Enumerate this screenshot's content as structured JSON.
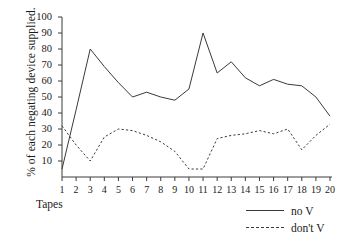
{
  "chart_data": {
    "type": "line",
    "title": "",
    "xlabel": "Tapes",
    "ylabel": "% of each negating device supplied.",
    "xlim": [
      1,
      20
    ],
    "ylim": [
      0,
      100
    ],
    "grid": false,
    "legend_position": "bottom-right",
    "x": [
      1,
      2,
      3,
      4,
      5,
      6,
      7,
      8,
      9,
      10,
      11,
      12,
      13,
      14,
      15,
      16,
      17,
      18,
      19,
      20
    ],
    "xtick_labels": [
      "1",
      "2",
      "3",
      "4",
      "5",
      "6",
      "7",
      "8",
      "9",
      "10",
      "11",
      "12",
      "13",
      "14",
      "15",
      "16",
      "17",
      "18",
      "19",
      "20"
    ],
    "ytick_labels": [
      "10",
      "20",
      "30",
      "40",
      "50",
      "60",
      "70",
      "80",
      "90",
      "100"
    ],
    "yticks": [
      10,
      20,
      30,
      40,
      50,
      60,
      70,
      80,
      90,
      100
    ],
    "series": [
      {
        "name": "no V",
        "style": "solid",
        "color": "#3a3a3a",
        "values": [
          5,
          42,
          80,
          69,
          59,
          50,
          53,
          50,
          48,
          55,
          90,
          65,
          72,
          62,
          57,
          61,
          58,
          57,
          50,
          38
        ]
      },
      {
        "name": "don't V",
        "style": "dashed",
        "color": "#3a3a3a",
        "values": [
          32,
          20,
          10,
          25,
          30,
          29,
          26,
          22,
          16,
          5,
          5,
          24,
          26,
          27,
          29,
          27,
          30,
          17,
          26,
          33
        ]
      }
    ]
  },
  "axis": {
    "y_title": "% of each negating device supplied.",
    "x_title": "Tapes"
  },
  "legend": {
    "items": [
      {
        "label": "no V",
        "style": "solid"
      },
      {
        "label": "don't V",
        "style": "dashed"
      }
    ]
  }
}
